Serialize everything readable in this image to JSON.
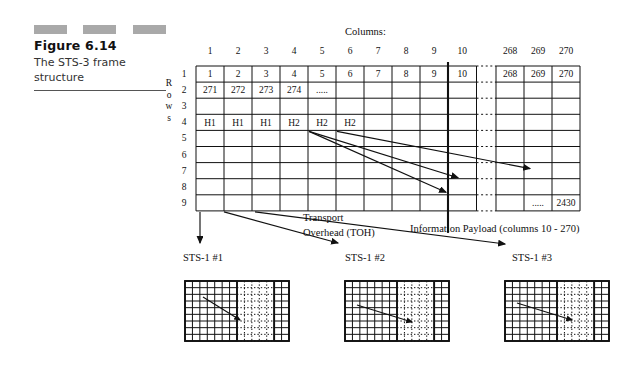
{
  "caption": {
    "figure_number": "Figure 6.14",
    "description": "The STS-3 frame structure"
  },
  "diagram": {
    "columns_title": "Columns:",
    "rows_label": "Rows",
    "column_headers": [
      "1",
      "2",
      "3",
      "4",
      "5",
      "6",
      "7",
      "8",
      "9",
      "10",
      "268",
      "269",
      "270"
    ],
    "row_headers": [
      "1",
      "2",
      "3",
      "4",
      "5",
      "6",
      "7",
      "8",
      "9"
    ],
    "row1_cells": [
      "1",
      "2",
      "3",
      "4",
      "5",
      "6",
      "7",
      "8",
      "9",
      "10",
      "268",
      "269",
      "270"
    ],
    "row2_cells": [
      "271",
      "272",
      "273",
      "274",
      "....."
    ],
    "row4_cells": [
      "H1",
      "H1",
      "H1",
      "H2",
      "H2",
      "H2"
    ],
    "row9_tail": ".....",
    "row9_last": "2430",
    "annotations": {
      "toh_line1": "Transport",
      "toh_line2": "Overhead (TOH)",
      "payload": "Information Payload (columns 10 - 270)"
    },
    "sts_labels": [
      "STS-1 #1",
      "STS-1 #2",
      "STS-1 #3"
    ]
  }
}
